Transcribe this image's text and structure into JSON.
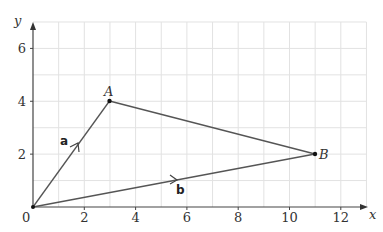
{
  "diagram": {
    "axes": {
      "x_label": "x",
      "y_label": "y",
      "origin_label": "0",
      "x_ticks": [
        "2",
        "4",
        "6",
        "8",
        "10",
        "12"
      ],
      "y_ticks": [
        "2",
        "4",
        "6"
      ],
      "x_range": [
        0,
        13
      ],
      "y_range": [
        0,
        7
      ],
      "grid": true
    },
    "points": [
      {
        "name": "A",
        "x": 3,
        "y": 4
      },
      {
        "name": "B",
        "x": 11,
        "y": 2
      }
    ],
    "vectors": [
      {
        "name": "a",
        "from": [
          0,
          0
        ],
        "to": [
          3,
          4
        ]
      },
      {
        "name": "b",
        "from": [
          0,
          0
        ],
        "to": [
          11,
          2
        ]
      }
    ],
    "segments": [
      {
        "from": "A",
        "to": "B"
      }
    ],
    "colors": {
      "grid": "#e2e2e2",
      "line": "#555555",
      "axis": "#444444"
    }
  }
}
